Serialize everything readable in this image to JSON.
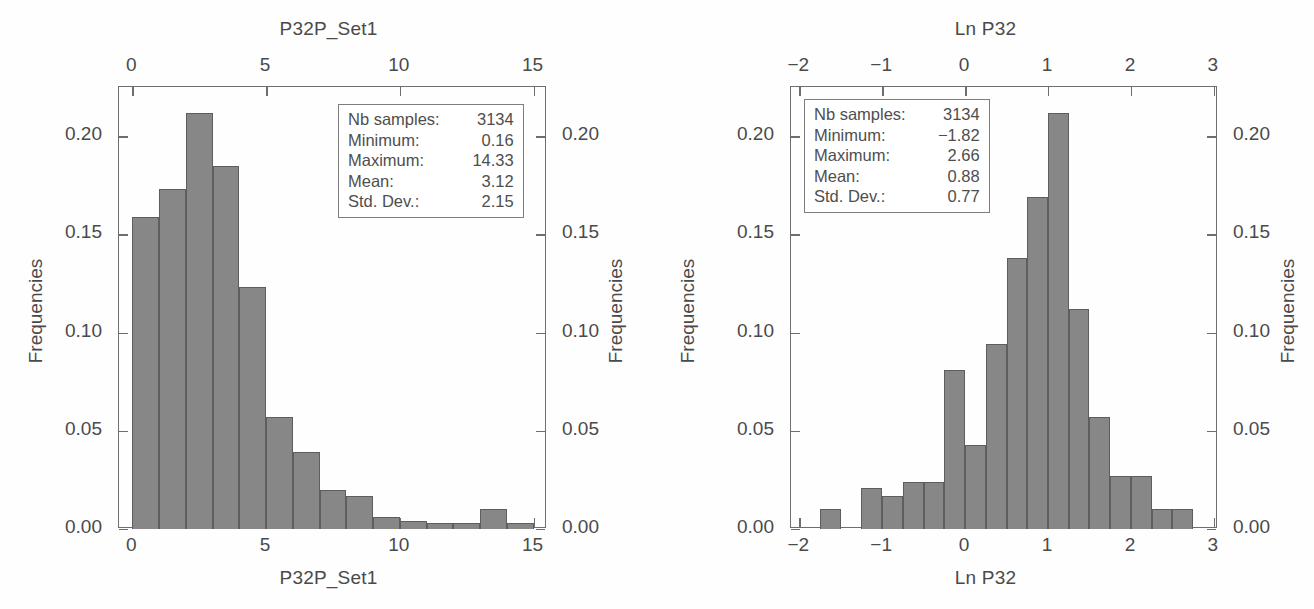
{
  "figure": {
    "background": "#ffffff",
    "bar_fill": "#878787",
    "axis_color": "#6e6e6e",
    "text_color": "#4a4a4a"
  },
  "panels": [
    {
      "id": "left",
      "title_top": "P32P_Set1",
      "title_bottom": "P32P_Set1",
      "ylabel_left": "Frequencies",
      "ylabel_right": "Frequencies",
      "stats": {
        "rows": [
          {
            "key": "Nb samples:",
            "value": "3134"
          },
          {
            "key": "Minimum:",
            "value": "0.16"
          },
          {
            "key": "Maximum:",
            "value": "14.33"
          },
          {
            "key": "Mean:",
            "value": "3.12"
          },
          {
            "key": "Std. Dev.:",
            "value": "2.15"
          }
        ]
      },
      "xticks": [
        "0",
        "5",
        "10",
        "15"
      ],
      "yticks": [
        "0.00",
        "0.05",
        "0.10",
        "0.15",
        "0.20"
      ]
    },
    {
      "id": "right",
      "title_top": "Ln P32",
      "title_bottom": "Ln P32",
      "ylabel_left": "Frequencies",
      "ylabel_right": "Frequencies",
      "stats": {
        "rows": [
          {
            "key": "Nb samples:",
            "value": "3134"
          },
          {
            "key": "Minimum:",
            "value": "−1.82"
          },
          {
            "key": "Maximum:",
            "value": "2.66"
          },
          {
            "key": "Mean:",
            "value": "0.88"
          },
          {
            "key": "Std. Dev.:",
            "value": "0.77"
          }
        ]
      },
      "xticks": [
        "−2",
        "−1",
        "0",
        "1",
        "2",
        "3"
      ],
      "yticks": [
        "0.00",
        "0.05",
        "0.10",
        "0.15",
        "0.20"
      ]
    }
  ],
  "chart_data": [
    {
      "type": "bar",
      "subtype": "histogram",
      "title": "P32P_Set1",
      "xlabel": "P32P_Set1",
      "ylabel": "Frequencies",
      "xlim": [
        -0.5,
        15.5
      ],
      "ylim": [
        0.0,
        0.225
      ],
      "xticks": [
        0,
        5,
        10,
        15
      ],
      "yticks": [
        0.0,
        0.05,
        0.1,
        0.15,
        0.2
      ],
      "grid": false,
      "legend": "none",
      "bin_width": 1.0,
      "bin_starts": [
        0,
        1,
        2,
        3,
        4,
        5,
        6,
        7,
        8,
        9,
        10,
        11,
        12,
        13,
        14
      ],
      "values": [
        0.159,
        0.173,
        0.212,
        0.185,
        0.123,
        0.057,
        0.039,
        0.02,
        0.017,
        0.006,
        0.004,
        0.003,
        0.003,
        0.01,
        0.003
      ],
      "annotations": {
        "Nb samples": 3134,
        "Minimum": 0.16,
        "Maximum": 14.33,
        "Mean": 3.12,
        "Std. Dev.": 2.15
      }
    },
    {
      "type": "bar",
      "subtype": "histogram",
      "title": "Ln P32",
      "xlabel": "Ln P32",
      "ylabel": "Frequencies",
      "xlim": [
        -2.1,
        3.05
      ],
      "ylim": [
        0.0,
        0.225
      ],
      "xticks": [
        -2,
        -1,
        0,
        1,
        2,
        3
      ],
      "yticks": [
        0.0,
        0.05,
        0.1,
        0.15,
        0.2
      ],
      "grid": false,
      "legend": "none",
      "bin_width": 0.25,
      "bin_starts": [
        -1.75,
        -1.5,
        -1.25,
        -1.0,
        -0.75,
        -0.5,
        -0.25,
        0.0,
        0.25,
        0.5,
        0.75,
        1.0,
        1.25,
        1.5,
        1.75,
        2.0,
        2.25,
        2.5
      ],
      "values": [
        0.01,
        0.0,
        0.021,
        0.017,
        0.024,
        0.024,
        0.081,
        0.043,
        0.094,
        0.138,
        0.169,
        0.212,
        0.112,
        0.057,
        0.027,
        0.027,
        0.01,
        0.01
      ],
      "annotations": {
        "Nb samples": 3134,
        "Minimum": -1.82,
        "Maximum": 2.66,
        "Mean": 0.88,
        "Std. Dev.": 0.77
      }
    }
  ]
}
